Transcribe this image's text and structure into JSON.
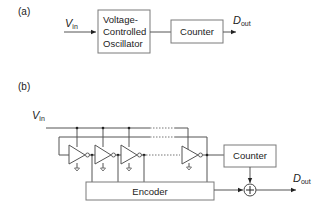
{
  "part_a": {
    "label": "(a)",
    "input": {
      "main": "V",
      "sub": "in"
    },
    "vco_lines": [
      "Voltage-",
      "Controlled",
      "Oscillator"
    ],
    "counter": "Counter",
    "output": {
      "main": "D",
      "sub": "out"
    }
  },
  "part_b": {
    "label": "(b)",
    "input": {
      "main": "V",
      "sub": "in"
    },
    "counter": "Counter",
    "encoder": "Encoder",
    "adder_symbol": "+",
    "output": {
      "main": "D",
      "sub": "out"
    },
    "inverter_count_visible": 4
  }
}
